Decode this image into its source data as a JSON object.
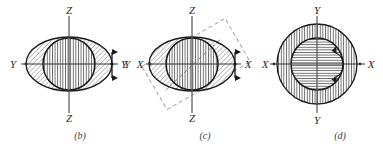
{
  "figure": {
    "background_color": "#ffffff",
    "ink_color": "#2b2b2b",
    "outline_color": "#1a1a1a",
    "hatch_color": "#4a4a4a",
    "dashed_color": "#8a8a8a",
    "panel_count": 3
  },
  "panels": [
    {
      "id": "panel-b",
      "caption": "(b)",
      "shape_outer": "ellipse",
      "shape_inner": "circle",
      "outer_hatch": "diagonal",
      "inner_hatch": "vertical",
      "axes": [
        {
          "name": "vertical-axis",
          "label_top": "Z",
          "label_bottom": "Z"
        },
        {
          "name": "horizontal-axis",
          "label_left": "Y",
          "label_right": "Y"
        }
      ],
      "marker": {
        "name": "double-arrow-vertical",
        "orientation": "vertical",
        "heads": 2
      },
      "labels": {
        "top": "Z",
        "bottom": "Z",
        "left": "Y",
        "right": "Y"
      }
    },
    {
      "id": "panel-c",
      "caption": "(c)",
      "shape_outer": "ellipse",
      "shape_inner": "circle",
      "outer_hatch": "diagonal",
      "inner_hatch": "vertical",
      "axes": [
        {
          "name": "vertical-axis",
          "label_top": "Z",
          "label_bottom": "Z"
        },
        {
          "name": "horizontal-axis",
          "label_left": "X",
          "label_right": "X"
        }
      ],
      "marker": {
        "name": "double-arrow-vertical",
        "orientation": "vertical",
        "heads": 2
      },
      "dashed_rectangle": {
        "name": "rotated-section-plane",
        "rotation_deg": -30,
        "style": "dashed"
      },
      "dashed_diagonal": {
        "name": "section-trace-line",
        "style": "dashed"
      },
      "labels": {
        "top": "Z",
        "bottom": "Z",
        "far_left": "Y",
        "left": "X",
        "right": "X"
      }
    },
    {
      "id": "panel-d",
      "caption": "(d)",
      "shape_outer": "circle",
      "shape_inner": "circle",
      "outer_hatch": "vertical",
      "inner_hatch": "horizontal",
      "axes": [
        {
          "name": "vertical-axis",
          "label_top": "Y",
          "label_bottom": "Y"
        },
        {
          "name": "horizontal-axis",
          "label_left": "X",
          "label_right": "X"
        }
      ],
      "marker": {
        "name": "curved-double-arrow",
        "orientation": "arc",
        "heads": 2
      },
      "labels": {
        "top": "Y",
        "bottom": "Y",
        "left": "X",
        "right": "X"
      }
    }
  ]
}
